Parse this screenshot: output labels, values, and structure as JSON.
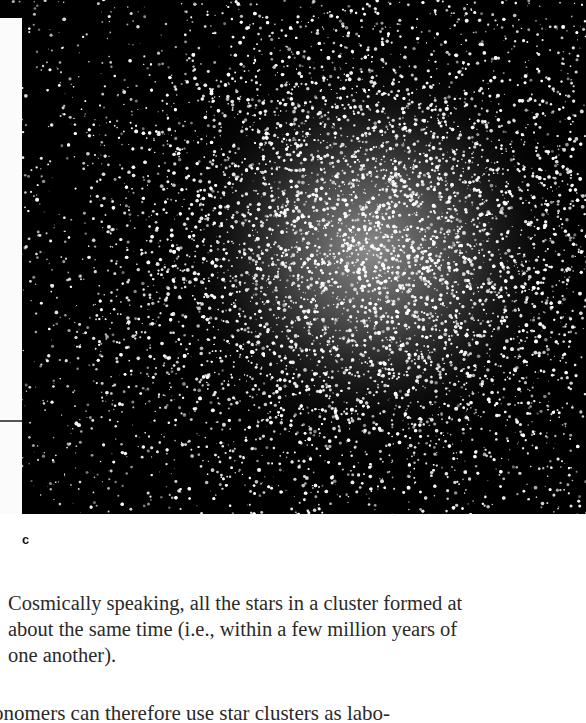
{
  "figure": {
    "panel_label": "c",
    "image_description": "Globular star cluster photograph, dense bright core right of center on black sky",
    "colors": {
      "sky": "#000000",
      "stars": "#ffffff"
    }
  },
  "caption": {
    "text": "Cosmically speaking, all the stars in a cluster formed at about the same time (i.e., within a few million years of one another)."
  },
  "body": {
    "partial_line": "ronomers can therefore use star clusters as labo-"
  }
}
